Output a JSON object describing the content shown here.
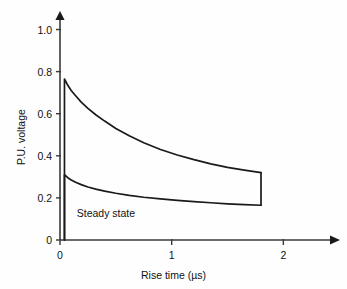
{
  "figure": {
    "background_color": "#fefefe",
    "line_color": "#1a1a1a",
    "axis_color": "#3a3a3a"
  },
  "chart_data": {
    "type": "line",
    "title": "",
    "xlabel": "Rise time (µs)",
    "ylabel": "P.U. voltage",
    "xlim": [
      0,
      2.4
    ],
    "ylim": [
      0,
      1.05
    ],
    "xticks": [
      0,
      1,
      2
    ],
    "xticklabels": [
      "0",
      "1",
      "2"
    ],
    "yticks": [
      0,
      0.2,
      0.4,
      0.6,
      0.8,
      1.0
    ],
    "yticklabels": [
      "0",
      "0.2",
      "0.4",
      "0.6",
      "0.8",
      "1.0"
    ],
    "grid": false,
    "legend": false,
    "annotations": [
      {
        "text": "Steady state",
        "x": 0.15,
        "y": 0.125
      }
    ],
    "series": [
      {
        "name": "Peak voltage envelope",
        "x": [
          0.04,
          0.04,
          0.07,
          0.1,
          0.14,
          0.19,
          0.25,
          0.32,
          0.4,
          0.5,
          0.62,
          0.75,
          0.9,
          1.05,
          1.2,
          1.35,
          1.5,
          1.65,
          1.8
        ],
        "values": [
          0.0,
          0.765,
          0.735,
          0.71,
          0.685,
          0.655,
          0.625,
          0.595,
          0.565,
          0.53,
          0.495,
          0.462,
          0.43,
          0.404,
          0.382,
          0.362,
          0.345,
          0.332,
          0.32
        ]
      },
      {
        "name": "Steady state envelope",
        "x": [
          0.04,
          0.04,
          0.07,
          0.1,
          0.14,
          0.19,
          0.25,
          0.32,
          0.4,
          0.5,
          0.62,
          0.75,
          0.9,
          1.05,
          1.2,
          1.35,
          1.5,
          1.65,
          1.8
        ],
        "values": [
          0.0,
          0.31,
          0.296,
          0.285,
          0.274,
          0.263,
          0.252,
          0.242,
          0.232,
          0.222,
          0.212,
          0.203,
          0.195,
          0.188,
          0.182,
          0.177,
          0.172,
          0.168,
          0.165
        ]
      },
      {
        "name": "Terminating connector",
        "x": [
          1.8,
          1.8
        ],
        "values": [
          0.32,
          0.165
        ]
      }
    ]
  },
  "axes": {
    "x_axis_name": "x-axis",
    "y_axis_name": "y-axis"
  }
}
